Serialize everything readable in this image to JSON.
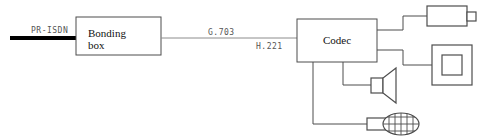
{
  "diagram": {
    "colors": {
      "line": "#4d4d4d",
      "thick_line": "#000000",
      "box_stroke": "#4d4d4d",
      "label_text": "#555555",
      "box_text": "#111111",
      "background": "#ffffff"
    },
    "boxes": [
      {
        "id": "bonding-box",
        "label": "Bonding\nbox"
      },
      {
        "id": "codec-box",
        "label": "Codec"
      }
    ],
    "link_labels": [
      {
        "id": "pr-isdn",
        "text": "PR-ISDN"
      },
      {
        "id": "g703",
        "text": "G.703"
      },
      {
        "id": "h221",
        "text": "H.221"
      }
    ],
    "devices": [
      {
        "id": "camera",
        "name": "camera"
      },
      {
        "id": "monitor",
        "name": "monitor"
      },
      {
        "id": "loudspeaker",
        "name": "loudspeaker"
      },
      {
        "id": "microphone",
        "name": "microphone"
      }
    ]
  }
}
